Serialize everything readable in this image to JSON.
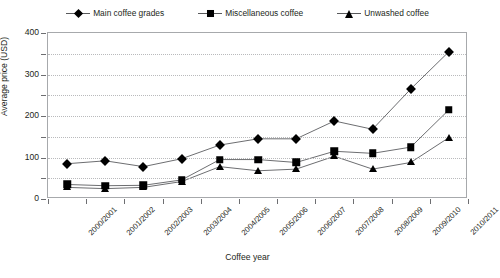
{
  "chart_data": {
    "type": "line",
    "title": "",
    "xlabel": "Coffee year",
    "ylabel": "Average price (USD)",
    "ylim": [
      0,
      400
    ],
    "ytick_major": [
      0,
      100,
      200,
      300,
      400
    ],
    "ytick_minor": [
      50,
      150,
      250,
      350
    ],
    "grid": "horizontal-dotted",
    "legend_position": "top-center",
    "categories": [
      "2000/2001",
      "2001/2002",
      "2002/2003",
      "2003/2004",
      "2004/2005",
      "2005/2006",
      "2006/2007",
      "2007/2008",
      "2008/2009",
      "2009/2010",
      "2010/2011"
    ],
    "series": [
      {
        "name": "Main coffee grades",
        "marker": "diamond",
        "values": [
          85,
          92,
          78,
          97,
          130,
          145,
          145,
          188,
          168,
          265,
          355
        ]
      },
      {
        "name": "Miscellaneous coffee",
        "marker": "square",
        "values": [
          35,
          32,
          33,
          46,
          95,
          95,
          88,
          115,
          110,
          125,
          215
        ]
      },
      {
        "name": "Unwashed coffee",
        "marker": "triangle",
        "values": [
          28,
          25,
          28,
          42,
          78,
          68,
          72,
          103,
          72,
          88,
          148
        ]
      }
    ],
    "colors": {
      "marker": "#000000",
      "line": "#6d6e71",
      "grid": "#b9babc",
      "axis": "#a7a9ac",
      "text": "#231f20"
    }
  },
  "legend": {
    "items": [
      {
        "label": "Main coffee grades",
        "marker": "diamond"
      },
      {
        "label": "Miscellaneous coffee",
        "marker": "square"
      },
      {
        "label": "Unwashed coffee",
        "marker": "triangle"
      }
    ]
  }
}
